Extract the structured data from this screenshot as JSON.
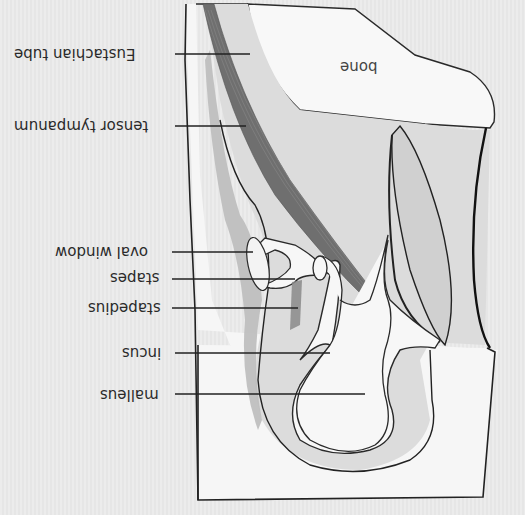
{
  "diagram": {
    "orientation": "upside-down",
    "colors": {
      "background": "#eaeaea",
      "bone_fill": "#f7f7f7",
      "outline": "#222222",
      "muscle_dark": "#6e6e6e",
      "muscle_light": "#a8a8a8",
      "cavity_gray": "#d6d6d6",
      "leader_line": "#222222"
    },
    "labels": [
      {
        "id": "eustachian_tube",
        "text": "Eustachian tube"
      },
      {
        "id": "tensor_tympanum",
        "text": "tensor tympanum"
      },
      {
        "id": "oval_window",
        "text": "oval window"
      },
      {
        "id": "stapes",
        "text": "stapes"
      },
      {
        "id": "stapedius",
        "text": "stapedius"
      },
      {
        "id": "incus",
        "text": "incus"
      },
      {
        "id": "malleus",
        "text": "malleus"
      },
      {
        "id": "bone",
        "text": "bone"
      }
    ]
  }
}
